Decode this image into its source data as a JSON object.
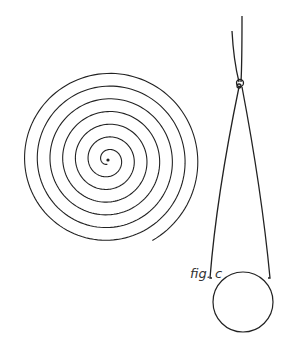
{
  "figure": {
    "caption": "fig. c",
    "stroke_color": "#222222",
    "spiral": {
      "cx": 108,
      "cy": 160,
      "turns": 7,
      "outer_radius": 92
    },
    "pendulum": {
      "knot": [
        240,
        83
      ],
      "bob_center": [
        243,
        302
      ],
      "bob_radius": 30
    }
  }
}
